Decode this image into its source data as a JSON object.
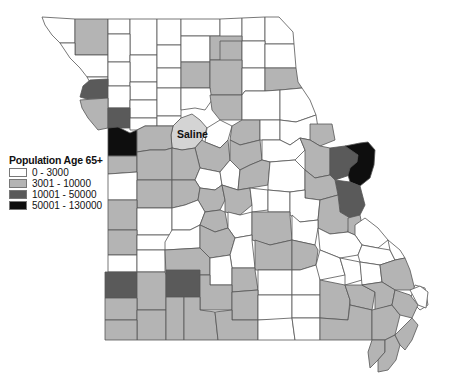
{
  "map": {
    "title": "Population Age 65+ by County, Missouri",
    "highlighted_county": "Saline",
    "colors": {
      "class0": "#ffffff",
      "class1": "#b4b4b4",
      "class2": "#5a5a5a",
      "class3": "#0e0e0e",
      "highlight": "#d4d4d4",
      "border": "#555555"
    }
  },
  "legend": {
    "title": "Population Age 65+",
    "items": [
      {
        "label": "0 - 3000",
        "color": "#ffffff"
      },
      {
        "label": "3001 - 10000",
        "color": "#b4b4b4"
      },
      {
        "label": "10001 - 50000",
        "color": "#5a5a5a"
      },
      {
        "label": "50001 - 130000",
        "color": "#0e0e0e"
      }
    ]
  },
  "labels": {
    "saline": "Saline"
  }
}
